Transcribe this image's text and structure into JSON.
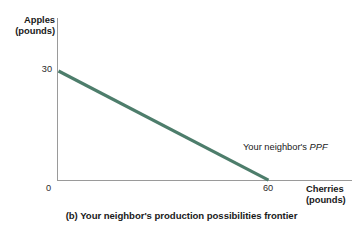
{
  "figure": {
    "caption": "(b) Your neighbor's production possibilities frontier",
    "background_color": "#ffffff",
    "axis_color": "#9a9a9a"
  },
  "chart_data": {
    "type": "line",
    "title": "",
    "subtitle": "",
    "xlabel": "Cherries",
    "xlabel_units": "(pounds)",
    "ylabel": "Apples",
    "ylabel_units": "(pounds)",
    "xlim": [
      0,
      70
    ],
    "ylim": [
      0,
      35
    ],
    "grid": false,
    "legend_position": "inline-annotation",
    "x_ticks": [
      "0",
      "60"
    ],
    "x_tick_values": [
      0,
      60
    ],
    "y_ticks": [
      "30"
    ],
    "y_tick_values": [
      30
    ],
    "origin_label": "0",
    "series": [
      {
        "name": "Your neighbor's PPF",
        "color": "#4d7d6b",
        "x": [
          0,
          60
        ],
        "values": [
          30,
          0
        ],
        "annotation": "Your neighbor's PPF",
        "annotation_plain": "Your neighbor's ",
        "annotation_italic": "PPF"
      }
    ]
  }
}
